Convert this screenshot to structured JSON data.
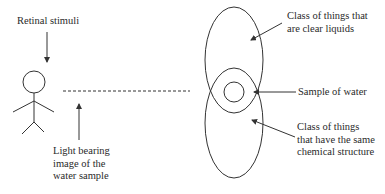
{
  "diagram": {
    "type": "concept-diagram",
    "stroke_color": "#333333",
    "labels": {
      "retinal_stimuli": "Retinal stimuli",
      "light_bearing": [
        "Light bearing",
        "image of the",
        "water sample"
      ],
      "clear_liquids": [
        "Class of things that",
        "are clear liquids"
      ],
      "sample_of_water": "Sample of water",
      "chemical_structure": [
        "Class of things",
        "that have the same",
        "chemical structure"
      ]
    },
    "elements": {
      "observer": "stick-figure",
      "top_ellipse": "class-of-clear-liquids",
      "bottom_ellipse": "class-of-same-chemical-structure",
      "inner_circle": "sample-of-water",
      "dashed_line": "line-of-sight"
    }
  }
}
